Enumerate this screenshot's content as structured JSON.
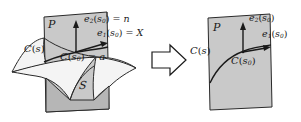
{
  "figure": {
    "type": "geometry-diagram",
    "background": "#ffffff",
    "ink": "#1a1a1a",
    "plane_fill": "#c9c9c9",
    "plane_fill_dark": "#b6b6b6",
    "surface_fill": "#f1f1f1",
    "transform_arrow": "hollow-right-arrow"
  },
  "left_panel": {
    "plane_label": "P",
    "normal_vector_label": {
      "base": "e",
      "sub": "2",
      "arg_open": "(",
      "arg_base": "s",
      "arg_sub": "0",
      "arg_close": ")",
      "equals": " = ",
      "value": "n"
    },
    "tangent_vector_label": {
      "base": "e",
      "sub": "1",
      "arg_open": "(",
      "arg_base": "s",
      "arg_sub": "0",
      "arg_close": ")",
      "equals": " = ",
      "value": "X"
    },
    "curve_label": {
      "base": "C",
      "arg_open": "(",
      "arg_base": "s",
      "arg_close": ")"
    },
    "point_label": {
      "base": "C",
      "arg_open": "(",
      "arg_base": "s",
      "arg_sub": "0",
      "arg_close": ")",
      "equals": " = ",
      "value": "a"
    },
    "surface_label": "S"
  },
  "right_panel": {
    "plane_label": "P",
    "normal_vector_label": {
      "base": "e",
      "sub": "2",
      "arg_open": "(",
      "arg_base": "s",
      "arg_sub": "0",
      "arg_close": ")"
    },
    "tangent_vector_label": {
      "base": "e",
      "sub": "1",
      "arg_open": "(",
      "arg_base": "s",
      "arg_sub": "0",
      "arg_close": ")"
    },
    "curve_label": {
      "base": "C",
      "arg_open": "(",
      "arg_base": "s",
      "arg_close": ")"
    },
    "point_label": {
      "base": "C",
      "arg_open": "(",
      "arg_base": "s",
      "arg_sub": "0",
      "arg_close": ")"
    }
  }
}
